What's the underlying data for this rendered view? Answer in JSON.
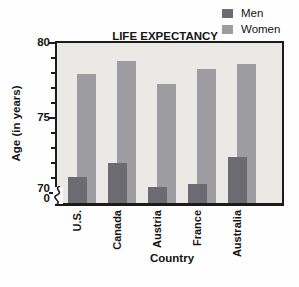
{
  "chart_data": {
    "type": "bar",
    "title": "LIFE EXPECTANCY",
    "xlabel": "Country",
    "ylabel": "Age (in years)",
    "categories": [
      "U.S.",
      "Canada",
      "Austria",
      "France",
      "Australia"
    ],
    "series": [
      {
        "name": "Men",
        "color": "#6b6b71",
        "values": [
          71.1,
          72.0,
          70.4,
          70.6,
          72.4
        ]
      },
      {
        "name": "Women",
        "color": "#9c9ca1",
        "values": [
          77.9,
          78.8,
          77.3,
          78.3,
          78.6
        ]
      }
    ],
    "ylim": [
      70,
      80
    ],
    "y_major_ticks": [
      80,
      75,
      70
    ],
    "y_minor_tick_step": 1,
    "axis_break_zero_label": "0",
    "axis_break": true,
    "legend_position": "top-right",
    "grid": false,
    "bar_style": "overlapped",
    "plot_background": "#ebe9e5",
    "frame_color": "#1b1b1b"
  }
}
